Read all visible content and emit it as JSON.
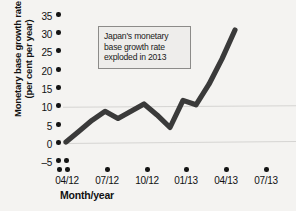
{
  "chart_data": {
    "type": "line",
    "title": "",
    "xlabel": "Month/year",
    "ylabel_line1": "Monetary base growth rate",
    "ylabel_line2": "(per cent per year)",
    "ylim": [
      -5,
      35
    ],
    "yticks": [
      35,
      30,
      25,
      20,
      15,
      10,
      5,
      0,
      -5
    ],
    "ytick_labels": [
      "35",
      "30",
      "25",
      "20",
      "15",
      "10",
      "5",
      "0",
      "–5"
    ],
    "xticks": [
      "04/12",
      "07/12",
      "10/12",
      "01/13",
      "04/13",
      "07/13"
    ],
    "grid": "horizontal gridlines at 0 and 10",
    "gridlines": [
      0,
      10
    ],
    "legend": "none",
    "series": [
      {
        "name": "Japan monetary base growth rate",
        "color": "#3a3a3a",
        "x": [
          "04/12",
          "05/12",
          "06/12",
          "07/12",
          "08/12",
          "09/12",
          "10/12",
          "11/12",
          "12/12",
          "01/13",
          "02/13",
          "03/13",
          "04/13",
          "05/13"
        ],
        "values": [
          0.0,
          3.0,
          6.0,
          8.5,
          6.5,
          8.5,
          10.5,
          7.5,
          4.0,
          11.5,
          10.3,
          16.0,
          23.0,
          31.0
        ]
      }
    ],
    "annotation": {
      "line1": "Japan's monetary",
      "line2": "base growth rate",
      "line3": "exploded in 2013"
    }
  },
  "colors": {
    "background": "#f4f3f1",
    "line": "#3a3a3a",
    "gridline": "#d5d4d2",
    "text": "#111111",
    "annotation_border": "#8c8b89",
    "annotation_fill": "#eeedeb"
  }
}
